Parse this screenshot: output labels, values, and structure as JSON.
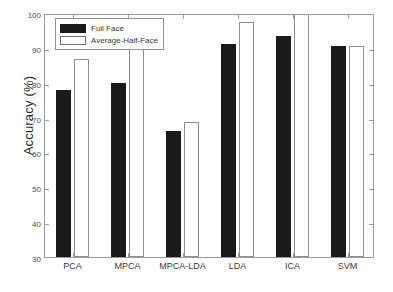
{
  "chart_data": {
    "type": "bar",
    "title": "",
    "xlabel": "",
    "ylabel": "Accuracy (%)",
    "categories": [
      "PCA",
      "MPCA",
      "MPCA-LDA",
      "LDA",
      "ICA",
      "SVM"
    ],
    "series": [
      {
        "name": "Full Face",
        "color": "#1a1a1a",
        "values": [
          78,
          80,
          66.2,
          91,
          93.4,
          90.6
        ]
      },
      {
        "name": "Average-Half-Face",
        "color": "#ffffff",
        "values": [
          86.8,
          92.8,
          68.8,
          97.5,
          101,
          90.6
        ]
      }
    ],
    "ylim": [
      30,
      100
    ],
    "yticks": [
      30,
      40,
      50,
      60,
      70,
      80,
      90,
      100
    ],
    "grid": false,
    "legend_position": "top-left"
  },
  "legend": {
    "entries": [
      {
        "label": "Full Face",
        "style": "full"
      },
      {
        "label": "Average-Half-Face",
        "style": "half"
      }
    ]
  }
}
